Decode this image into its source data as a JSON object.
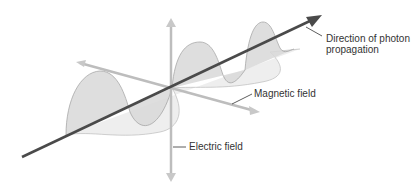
{
  "diagram": {
    "labels": {
      "propagation_line1": "Direction of photon",
      "propagation_line2": "propagation",
      "magnetic": "Magnetic field",
      "electric": "Electric field"
    },
    "colors": {
      "propagation_axis": "#4a4a4a",
      "field_axes": "#b8b8b8",
      "wave_fill": "#dcdcdc",
      "wave_stroke": "#9a9a9a",
      "magnetic_wave_fill": "#ececec",
      "leader_line": "#333333"
    }
  }
}
